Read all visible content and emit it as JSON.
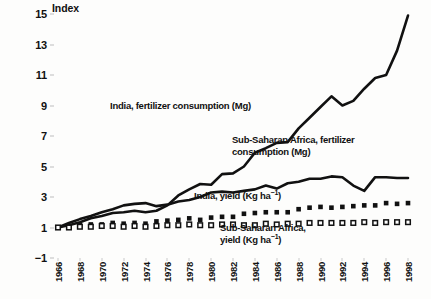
{
  "chart_data": {
    "type": "line",
    "title": "",
    "ylabel": "Index",
    "xlabel": "",
    "ylim": [
      -1,
      15
    ],
    "yticks": [
      15,
      13,
      11,
      9,
      7,
      5,
      3,
      1,
      -1
    ],
    "grid": false,
    "legend_position": "inline-annotations",
    "x": [
      1966,
      1967,
      1968,
      1969,
      1970,
      1971,
      1972,
      1973,
      1974,
      1975,
      1976,
      1977,
      1978,
      1979,
      1980,
      1981,
      1982,
      1983,
      1984,
      1985,
      1986,
      1987,
      1988,
      1989,
      1990,
      1991,
      1992,
      1993,
      1994,
      1995,
      1996,
      1997,
      1998
    ],
    "xtick_labels": [
      "1966",
      "1968",
      "1970",
      "1972",
      "1974",
      "1976",
      "1978",
      "1980",
      "1982",
      "1984",
      "1986",
      "1988",
      "1990",
      "1992",
      "1994",
      "1996",
      "1998"
    ],
    "series": [
      {
        "name": "India, fertilizer consumption (Mg)",
        "marker": "none",
        "style": "line",
        "color": "#111111",
        "values": [
          1.0,
          1.15,
          1.35,
          1.6,
          1.75,
          1.95,
          2.0,
          2.1,
          2.0,
          2.1,
          2.45,
          3.1,
          3.5,
          3.85,
          3.8,
          4.5,
          4.55,
          5.0,
          5.9,
          6.2,
          6.55,
          6.6,
          7.5,
          8.2,
          8.9,
          9.6,
          9.0,
          9.3,
          10.1,
          10.8,
          11.0,
          12.6,
          14.9
        ]
      },
      {
        "name": "Sub-Saharan Africa, fertilizer consumption (Mg)",
        "marker": "none",
        "style": "line",
        "color": "#111111",
        "values": [
          1.0,
          1.3,
          1.55,
          1.75,
          2.0,
          2.2,
          2.45,
          2.55,
          2.6,
          2.4,
          2.5,
          2.7,
          2.8,
          3.0,
          3.3,
          3.35,
          3.3,
          3.4,
          3.5,
          3.75,
          3.55,
          3.9,
          4.0,
          4.2,
          4.2,
          4.35,
          4.3,
          3.75,
          3.4,
          4.3,
          4.3,
          4.25,
          4.25
        ]
      },
      {
        "name": "India, yield (Kg ha-1)",
        "marker": "filled-square",
        "style": "markers",
        "color": "#111111",
        "values": [
          1.0,
          1.05,
          1.15,
          1.2,
          1.2,
          1.3,
          1.25,
          1.3,
          1.25,
          1.4,
          1.45,
          1.5,
          1.6,
          1.5,
          1.65,
          1.7,
          1.7,
          1.9,
          1.95,
          2.0,
          2.0,
          2.0,
          2.2,
          2.3,
          2.35,
          2.3,
          2.35,
          2.4,
          2.45,
          2.45,
          2.6,
          2.55,
          2.6
        ]
      },
      {
        "name": "Sub-Saharan Africa, yield (Kg ha-1)",
        "marker": "open-square",
        "style": "markers",
        "color": "#111111",
        "values": [
          1.0,
          1.0,
          1.05,
          1.05,
          1.1,
          1.1,
          1.05,
          1.1,
          1.05,
          1.1,
          1.15,
          1.15,
          1.2,
          1.15,
          1.15,
          1.2,
          1.2,
          1.15,
          1.15,
          1.25,
          1.2,
          1.25,
          1.25,
          1.3,
          1.3,
          1.3,
          1.3,
          1.3,
          1.35,
          1.3,
          1.35,
          1.35,
          1.35
        ]
      }
    ],
    "annotations": [
      {
        "id": "india-fert",
        "text": "India, fertilizer consumption (Mg)",
        "lines": [
          "India, fertilizer consumption (Mg)"
        ]
      },
      {
        "id": "ssa-fert",
        "text": "Sub-Saharan Africa, fertilizer consumption (Mg)",
        "lines": [
          "Sub-Saharan Africa, fertilizer",
          "consumption (Mg)"
        ]
      },
      {
        "id": "india-yield",
        "text": "India, yield (Kg ha-1)",
        "lines": [
          "India, yield (Kg ha-1)"
        ]
      },
      {
        "id": "ssa-yield",
        "text": "Sub-Saharan Africa, yield (Kg ha-1)",
        "lines": [
          "Sub-Saharan Africa,",
          "yield (Kg ha-1)"
        ]
      }
    ]
  },
  "labels": {
    "axis_title": "Index",
    "ann_india_fert": "India, fertilizer consumption (Mg)",
    "ann_ssa_fert_l1": "Sub-Saharan Africa, fertilizer",
    "ann_ssa_fert_l2": "consumption (Mg)",
    "ann_india_yield_main": "India, yield (Kg ha",
    "ann_india_yield_sup": "−1",
    "ann_india_yield_tail": ")",
    "ann_ssa_yield_l1": "Sub-Saharan Africa,",
    "ann_ssa_yield_l2_main": "yield (Kg ha",
    "ann_ssa_yield_l2_sup": "−1",
    "ann_ssa_yield_l2_tail": ")"
  }
}
